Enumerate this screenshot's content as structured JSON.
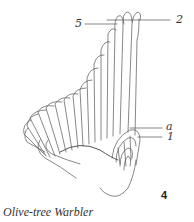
{
  "figure": {
    "caption": "Olive-tree Warbler",
    "figure_number": "4",
    "labels": {
      "p5": "5",
      "p2": "2",
      "a": "a",
      "p1": "1"
    },
    "line_color": "#555555"
  }
}
